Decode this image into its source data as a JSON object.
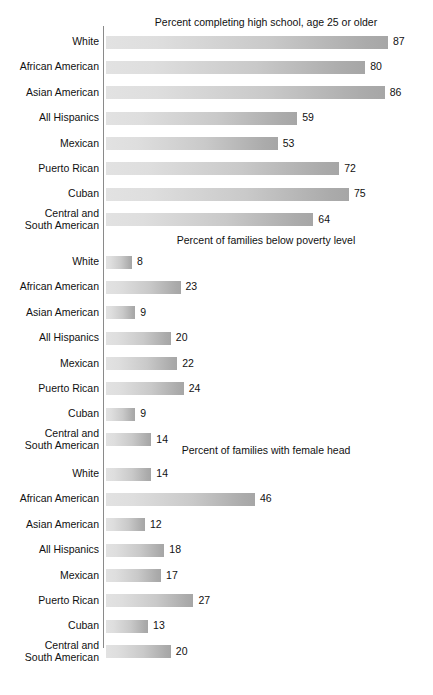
{
  "figure": {
    "background": "#ffffff",
    "bar_gradient_from": "#e2e2e2",
    "bar_gradient_to": "#a6a6a6",
    "axis_color": "#8a8a8a",
    "text_color": "#111111"
  },
  "chart_data": {
    "type": "bar",
    "orientation": "horizontal",
    "title": "",
    "xlabel": "",
    "ylabel": "",
    "grid": false,
    "legend": "none",
    "xlim": [
      0,
      100
    ],
    "categories": [
      "White",
      "African American",
      "Asian American",
      "All Hispanics",
      "Mexican",
      "Puerto Rican",
      "Cuban",
      "Central and\nSouth American"
    ],
    "panels": [
      {
        "title": "Percent completing high school, age 25 or older",
        "values": [
          87,
          80,
          86,
          59,
          53,
          72,
          75,
          64
        ]
      },
      {
        "title": "Percent of families below poverty level",
        "values": [
          8,
          23,
          9,
          20,
          22,
          24,
          9,
          14
        ]
      },
      {
        "title": "Percent of families with female head",
        "values": [
          14,
          46,
          12,
          18,
          17,
          27,
          13,
          20
        ]
      }
    ],
    "series": [
      {
        "name": "Percent completing high school, age 25 or older",
        "values": [
          87,
          80,
          86,
          59,
          53,
          72,
          75,
          64
        ]
      },
      {
        "name": "Percent of families below poverty level",
        "values": [
          8,
          23,
          9,
          20,
          22,
          24,
          9,
          14
        ]
      },
      {
        "name": "Percent of families with female head",
        "values": [
          14,
          46,
          12,
          18,
          17,
          27,
          13,
          20
        ]
      }
    ]
  },
  "layout": {
    "panel_tops": [
      16,
      234,
      444
    ],
    "rows_tops": [
      30,
      250,
      462
    ],
    "px_per_unit": 3.24
  }
}
